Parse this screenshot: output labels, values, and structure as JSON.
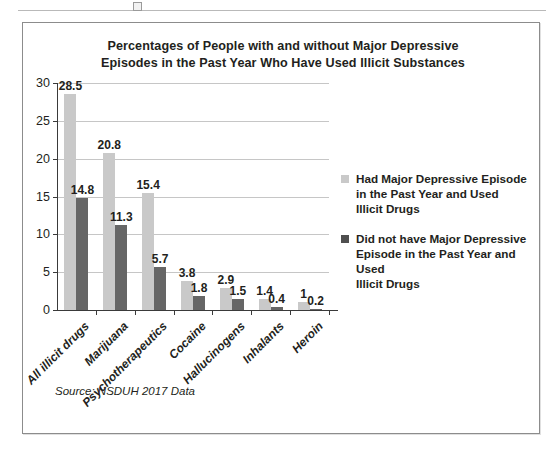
{
  "chart_data": {
    "type": "bar",
    "title": "Percentages of People with and without Major Depressive Episodes in the Past Year Who Have Used Illicit Substances",
    "title_line1": "Percentages of People with and without Major Depressive",
    "title_line2": "Episodes in the Past Year Who Have Used Illicit Substances",
    "xlabel": "",
    "ylabel": "",
    "ylim": [
      0,
      30
    ],
    "yticks": [
      0,
      5,
      10,
      15,
      20,
      25,
      30
    ],
    "ytick_labels": [
      "0",
      "5",
      "10",
      "15",
      "20",
      "25",
      "30"
    ],
    "grid": true,
    "legend_position": "right",
    "categories": [
      "All illicit drugs",
      "Marijuana",
      "Psychotherapeutics",
      "Cocaine",
      "Hallucinogens",
      "Inhalants",
      "Heroin"
    ],
    "series": [
      {
        "name": "Had Major Depressive Episode in the Past Year and Used Illicit Drugs",
        "color": "#c9c9c9",
        "values": [
          28.5,
          20.8,
          15.4,
          3.8,
          2.9,
          1.4,
          1
        ],
        "value_labels": [
          "28.5",
          "20.8",
          "15.4",
          "3.8",
          "2.9",
          "1.4",
          "1"
        ]
      },
      {
        "name": "Did not have Major Depressive Episode in the Past Year and Used Illicit Drugs",
        "color": "#666666",
        "values": [
          14.8,
          11.3,
          5.7,
          1.8,
          1.5,
          0.4,
          0.2
        ],
        "value_labels": [
          "14.8",
          "11.3",
          "5.7",
          "1.8",
          "1.5",
          "0.4",
          "0.2"
        ]
      }
    ],
    "source_note": "Source: NSDUH 2017 Data"
  },
  "legend": {
    "items": [
      {
        "swatch": "light",
        "line1": "Had Major Depressive Episode",
        "line2": "in the Past Year and Used",
        "line3": "Illicit Drugs"
      },
      {
        "swatch": "dark",
        "line1": "Did not have Major Depressive",
        "line2": "Episode in the Past Year and Used",
        "line3": "Illicit Drugs"
      }
    ]
  },
  "colors": {
    "series_light": "#c9c9c9",
    "series_dark": "#666666",
    "axis": "#3a3a3a",
    "grid": "#c6c6c6",
    "text": "#231f20",
    "frame": "#8c8c8c"
  }
}
